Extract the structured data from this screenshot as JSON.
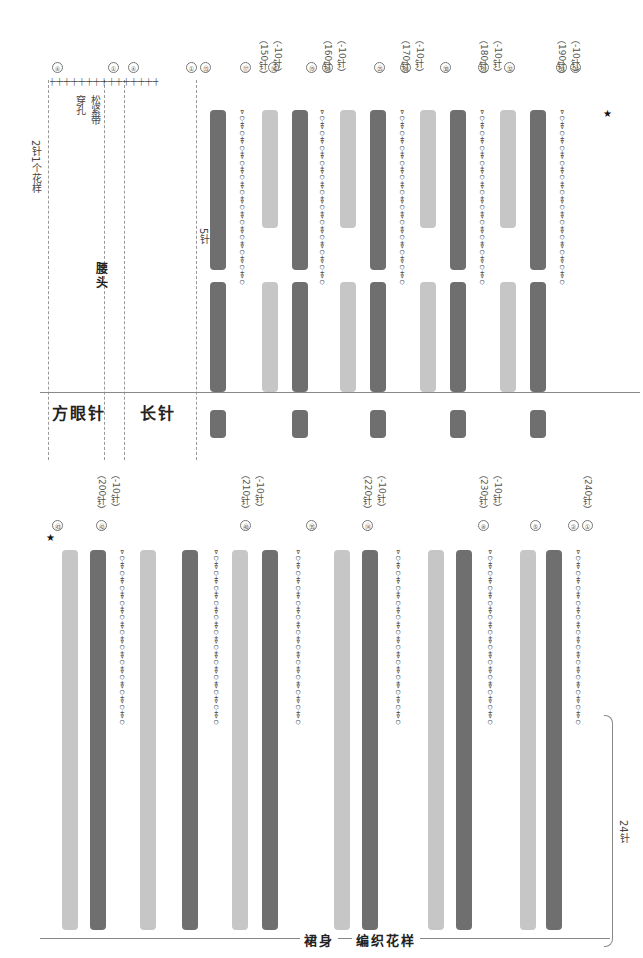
{
  "top_panel": {
    "section_labels": {
      "square_mesh": "方眼针",
      "double_crochet": "长针",
      "waistband": "腰头",
      "elastic_hole": "松紧带\n穿孔",
      "repeat_note": "2针1个花样",
      "five_stitches": "5针"
    },
    "row_markers": [
      "④",
      "①",
      "④",
      "①",
      "⑬",
      "⑰",
      "⑱",
      "⑲",
      "⑳",
      "㉕",
      "㉖",
      "㉚",
      "㉛",
      "㉜",
      "㉝",
      "㉞"
    ],
    "stitch_counts": [
      {
        "row": "⑱",
        "count": "（150针）",
        "change": "（-10针）"
      },
      {
        "row": "⑳",
        "count": "（160针）",
        "change": "（-10针）"
      },
      {
        "row": "㉖",
        "count": "（170针）",
        "change": "（-10针）"
      },
      {
        "row": "㉜",
        "count": "（180针）",
        "change": "（-10针）"
      },
      {
        "row": "㊳",
        "count": "（190针）",
        "change": "（-10针）"
      }
    ]
  },
  "bottom_panel": {
    "section_labels": {
      "skirt_body": "裙身",
      "pattern": "编织花样",
      "twenty_four": "24针"
    },
    "stitch_counts": [
      {
        "row": "㊷",
        "count": "（200针）",
        "change": "（-10针）"
      },
      {
        "row": "㊵",
        "count": "（210针）",
        "change": "（-10针）"
      },
      {
        "row": "⑭",
        "count": "（220针）",
        "change": "（-10针）"
      },
      {
        "row": "⑧",
        "count": "（230针）",
        "change": "（-10针）"
      },
      {
        "row": "①",
        "count": "（240针）",
        "change": ""
      }
    ],
    "row_markers": [
      "㊸",
      "㊷",
      "㊵",
      "㉟",
      "⑭",
      "⑧",
      "⑤",
      "②",
      "①"
    ]
  },
  "colors": {
    "dark_column": "#6f6f6f",
    "light_column": "#c6c6c6",
    "line": "#999999",
    "text": "#333333"
  },
  "glyphs": {
    "shell_row": "⊳◯+⊳◯+⊳◯+⊳◯+⊳◯+⊳◯+⊳◯+⊳◯+⊳◯+⊳◯+⊳◯+⊳◯",
    "dc_row": "┼╌┼╌┼╌┼╌┼╌┼╌┼╌┼╌┼╌┼╌┼╌┼╌┼╌┼╌┼",
    "star": "★"
  }
}
